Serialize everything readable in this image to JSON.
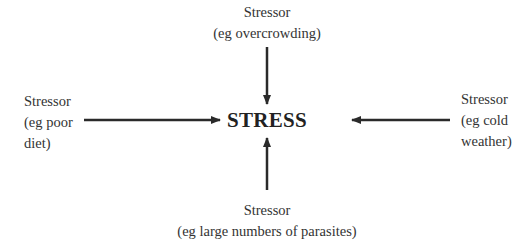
{
  "diagram": {
    "center": {
      "label": "STRESS"
    },
    "stressors": {
      "top": {
        "title": "Stressor",
        "example": "(eg overcrowding)"
      },
      "left": {
        "title": "Stressor",
        "example_line1": "(eg poor",
        "example_line2": "diet)"
      },
      "right": {
        "title": "Stressor",
        "example_line1": "(eg cold",
        "example_line2": "weather)"
      },
      "bottom": {
        "title": "Stressor",
        "example": "(eg large numbers of parasites)"
      }
    },
    "colors": {
      "arrow": "#2a2a2a",
      "text": "#333333",
      "background": "#ffffff"
    }
  }
}
